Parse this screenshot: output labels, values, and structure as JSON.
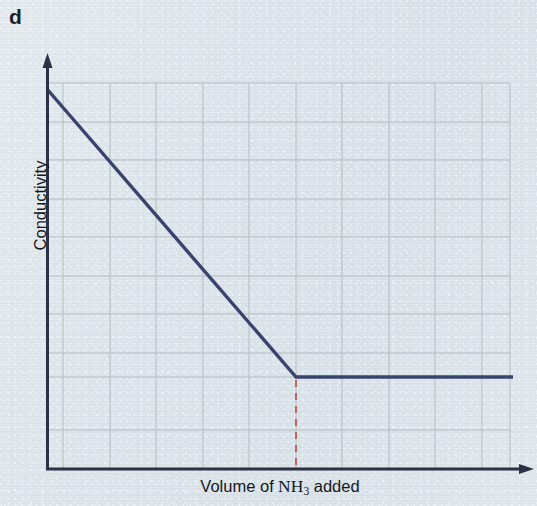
{
  "figure": {
    "panel_label": "d",
    "background_color": "#dde5ea",
    "axis_color": "#2b3245",
    "grid_color": "#b5bcc2",
    "curve_color": "#3a4270",
    "marker_color": "#b5564e"
  },
  "axes": {
    "y_title": "Conductivity",
    "x_title_prefix": "Volume of",
    "x_title_species": "NH",
    "x_title_species_sub": "3",
    "x_title_suffix": "added",
    "x_title_full": "Volume of NH3 added"
  },
  "chart_data": {
    "type": "line",
    "title": "",
    "subtitle": "",
    "xlabel": "Volume of NH3 added",
    "ylabel": "Conductivity",
    "xlim": [
      0,
      10
    ],
    "ylim": [
      0,
      10
    ],
    "x_tick_labels": [],
    "y_tick_labels": [],
    "grid": true,
    "grid_x_lines": 10,
    "grid_y_lines": 10,
    "legend": null,
    "legend_position": "none",
    "series": [
      {
        "name": "Conductivity vs volume of NH3 added",
        "color": "#3a4270",
        "style": "solid",
        "width_px": 3,
        "x": [
          0.0,
          5.35,
          10.0
        ],
        "y": [
          8.95,
          2.4,
          2.4
        ],
        "points_px": [
          {
            "x": 47,
            "y": 89
          },
          {
            "x": 296,
            "y": 377
          },
          {
            "x": 513,
            "y": 377
          }
        ],
        "description": "Conductivity falls steeply and linearly as NH3 is added, then levels off to a constant value after the equivalence point."
      }
    ],
    "annotations": [
      {
        "name": "equivalence-point-dropline",
        "type": "vertical-dashed-line",
        "color": "#b5564e",
        "x": 5.35,
        "y_from": 2.4,
        "y_to": 0.0,
        "x_px": 296,
        "y_from_px": 380,
        "y_to_px": 469,
        "label": ""
      }
    ]
  }
}
